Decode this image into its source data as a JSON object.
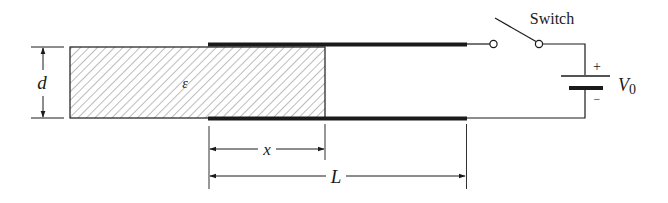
{
  "diagram": {
    "title": "",
    "labels": {
      "separation": "d",
      "permittivity": "ε",
      "insertion": "x",
      "length": "L",
      "switch": "Switch",
      "battery_plus": "+",
      "battery_minus": "−",
      "voltage": "V",
      "voltage_subscript": "0"
    },
    "components": [
      {
        "id": "dielectric-slab",
        "label": "ε",
        "hatched": true
      },
      {
        "id": "top-plate",
        "label": ""
      },
      {
        "id": "bottom-plate",
        "label": ""
      },
      {
        "id": "switch",
        "label": "Switch",
        "state": "open"
      },
      {
        "id": "battery",
        "label": "V0"
      }
    ],
    "dimensions": [
      {
        "id": "plate-separation",
        "label": "d"
      },
      {
        "id": "insertion-depth",
        "label": "x"
      },
      {
        "id": "plate-length",
        "label": "L"
      }
    ],
    "colors": {
      "ink": "#1a1a1a",
      "hatch": "#6a6a6a",
      "background": "#ffffff"
    }
  }
}
